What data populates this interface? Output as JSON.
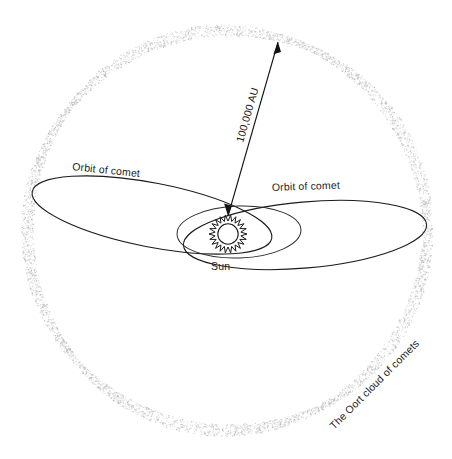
{
  "diagram": {
    "background_color": "#ffffff",
    "line_color": "#1b1b1b",
    "cloud_color": "#b9b9bd",
    "text_color": "#1d1d1d",
    "labels": {
      "orbit_left": "Orbit of comet",
      "orbit_right": "Orbit of comet",
      "sun": "Sun",
      "distance": "100,000 AU",
      "oort_cloud": "The Oort cloud of comets"
    },
    "elements": {
      "oort_cloud": {
        "name": "oort-cloud-boundary",
        "shape": "dotted-circle",
        "center_x": 227,
        "center_y": 230,
        "radius": 200,
        "style": "stippled band"
      },
      "sun": {
        "name": "sun-symbol",
        "shape": "sunburst",
        "center_x": 228,
        "center_y": 234,
        "outer_radius": 19,
        "inner_radius": 13,
        "core_radius": 10,
        "ray_count": 22
      },
      "comet_orbit_left": {
        "name": "comet-orbit-left",
        "shape": "ellipse",
        "center_x": 152,
        "center_y": 215,
        "rx": 122,
        "ry": 32,
        "rotation_deg": 11
      },
      "comet_orbit_right": {
        "name": "comet-orbit-right",
        "shape": "ellipse",
        "center_x": 305,
        "center_y": 235,
        "rx": 122,
        "ry": 33,
        "rotation_deg": -5
      },
      "inner_orbit": {
        "name": "inner-orbit",
        "shape": "ellipse",
        "center_x": 239,
        "center_y": 232,
        "rx": 62,
        "ry": 26,
        "rotation_deg": -2
      },
      "distance_arrow": {
        "name": "distance-arrow",
        "from_x": 228,
        "from_y": 216,
        "to_x": 278,
        "to_y": 42,
        "double_headed": true
      }
    },
    "label_positions": {
      "orbit_left": {
        "x": 72,
        "y": 170,
        "rotation_deg": 6
      },
      "orbit_right": {
        "x": 272,
        "y": 191,
        "rotation_deg": -2
      },
      "sun": {
        "x": 211,
        "y": 270,
        "rotation_deg": 0
      },
      "distance": {
        "x": 243,
        "y": 143,
        "rotation_deg": -74
      },
      "oort_cloud": {
        "x": 334,
        "y": 430,
        "rotation_deg": -45
      }
    }
  }
}
